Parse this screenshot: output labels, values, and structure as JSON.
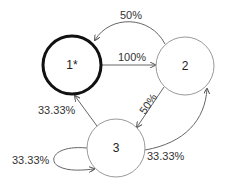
{
  "diagram": {
    "type": "state-transition",
    "nodes": [
      {
        "id": "1",
        "label": "1*",
        "initial": true
      },
      {
        "id": "2",
        "label": "2"
      },
      {
        "id": "3",
        "label": "3"
      }
    ],
    "edges": [
      {
        "from": "1",
        "to": "2",
        "label": "100%"
      },
      {
        "from": "2",
        "to": "1",
        "label": "50%"
      },
      {
        "from": "2",
        "to": "3",
        "label": "50%"
      },
      {
        "from": "3",
        "to": "1",
        "label": "33.33%"
      },
      {
        "from": "3",
        "to": "3",
        "label": "33.33%"
      },
      {
        "from": "3",
        "to": "2",
        "label": "33.33%"
      }
    ]
  }
}
